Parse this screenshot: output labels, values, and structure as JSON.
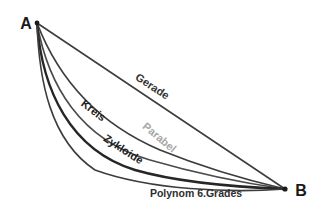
{
  "diagram": {
    "title_hint": "comparison of descent curves from A to B",
    "background": "#ffffff",
    "points": {
      "start": {
        "label": "A"
      },
      "end": {
        "label": "B"
      }
    },
    "point_color": "#1a1a1a",
    "curves": [
      {
        "id": "gerade",
        "label": "Gerade",
        "stroke": "#3d3d3d",
        "label_color": "#333333"
      },
      {
        "id": "kreis",
        "label": "Kreis",
        "stroke": "#3d3d3d",
        "label_color": "#1f1f1f"
      },
      {
        "id": "parabel",
        "label": "Parabel",
        "stroke": "#4a4a4a",
        "label_color": "#a8a8a8"
      },
      {
        "id": "zykloide",
        "label": "Zykloide",
        "stroke": "#262626",
        "label_color": "#1f1f1f"
      },
      {
        "id": "polynom",
        "label": "Polynom 6.Grades",
        "stroke": "#3d3d3d",
        "label_color": "#2e2e2e"
      }
    ]
  }
}
